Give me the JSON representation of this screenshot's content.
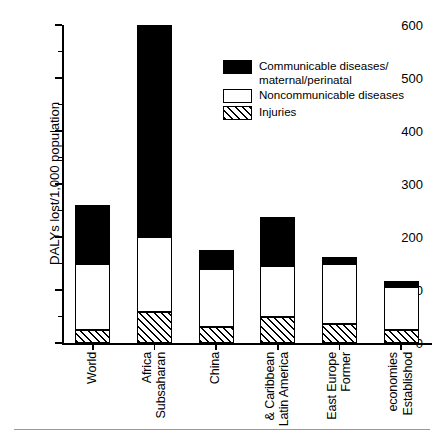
{
  "chart_data": {
    "type": "bar",
    "title": "",
    "xlabel": "",
    "ylabel": "DALYs lost/1,000 population",
    "ylim": [
      0,
      600
    ],
    "yticks": [
      0,
      100,
      200,
      300,
      400,
      500,
      600
    ],
    "ytick_labels": [
      "0",
      "100",
      "200",
      "300",
      "400",
      "500",
      "600"
    ],
    "yminor_ticks": [
      50,
      150,
      250,
      350,
      450,
      550
    ],
    "grid": false,
    "stacked": true,
    "legend_position": "upper-center-right",
    "categories": [
      "World",
      "Subsaharan Africa",
      "China",
      "Latin America & Caribbean",
      "Former East Europe",
      "Established economies"
    ],
    "category_lines": [
      [
        "World"
      ],
      [
        "Subsaharan",
        "Africa"
      ],
      [
        "China"
      ],
      [
        "Latin America",
        "& Caribbean"
      ],
      [
        "Former",
        "East Europe"
      ],
      [
        "Establishod",
        "economies"
      ]
    ],
    "series": [
      {
        "name": "Injuries",
        "pattern": "hatched",
        "values": [
          25,
          58,
          30,
          50,
          35,
          25
        ]
      },
      {
        "name": "Noncommunicable diseases",
        "pattern": "white",
        "values": [
          125,
          142,
          110,
          95,
          115,
          80
        ]
      },
      {
        "name": "Communicable diseases/maternal/perinatal",
        "pattern": "black",
        "values": [
          110,
          400,
          35,
          92,
          13,
          12
        ]
      }
    ],
    "totals": [
      260,
      600,
      175,
      237,
      163,
      117
    ]
  },
  "legend": {
    "items": [
      {
        "label": "Communicable diseases/\nmaternal/perinatal",
        "pattern": "black"
      },
      {
        "label": "Noncommunicable diseases",
        "pattern": "white"
      },
      {
        "label": "Injuries",
        "pattern": "hatched"
      }
    ]
  },
  "colors": {
    "ink": "#000000",
    "background": "#ffffff",
    "rule": "#9a9a9a"
  }
}
